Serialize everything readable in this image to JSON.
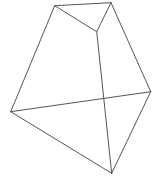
{
  "figure": {
    "type": "polyhedron-line-drawing",
    "stroke_color": "#555555",
    "stroke_width": 1,
    "background": "#ffffff",
    "vertices": {
      "A": [
        54.7,
        5.7
      ],
      "B": [
        111,
        2.7
      ],
      "C": [
        96.7,
        31.7
      ],
      "D": [
        10.7,
        111.7
      ],
      "E": [
        150.7,
        91.7
      ],
      "F": [
        111.7,
        173.3
      ]
    },
    "edges": [
      {
        "id": "A-B",
        "from": "A",
        "to": "B"
      },
      {
        "id": "A-C",
        "from": "A",
        "to": "C"
      },
      {
        "id": "B-C",
        "from": "B",
        "to": "C"
      },
      {
        "id": "A-D",
        "from": "A",
        "to": "D"
      },
      {
        "id": "B-E",
        "from": "B",
        "to": "E"
      },
      {
        "id": "C-F",
        "from": "C",
        "to": "F"
      },
      {
        "id": "D-E",
        "from": "D",
        "to": "E"
      },
      {
        "id": "D-F",
        "from": "D",
        "to": "F"
      },
      {
        "id": "E-F",
        "from": "E",
        "to": "F"
      }
    ]
  }
}
